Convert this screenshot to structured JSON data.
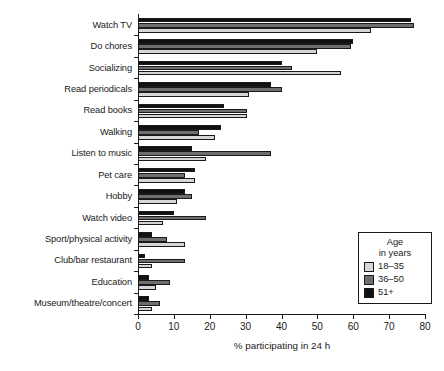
{
  "chart_data": {
    "type": "bar",
    "orientation": "horizontal",
    "title": "",
    "xlabel": "% participating in 24 h",
    "ylabel": "",
    "xlim": [
      0,
      80
    ],
    "xticks": [
      0,
      10,
      20,
      30,
      40,
      50,
      60,
      70,
      80
    ],
    "grid": false,
    "legend_position": "lower-right",
    "legend_title": [
      "Age",
      "in years"
    ],
    "categories": [
      "Watch TV",
      "Do chores",
      "Socializing",
      "Read periodicals",
      "Read books",
      "Walking",
      "Listen to music",
      "Pet care",
      "Hobby",
      "Watch video",
      "Sport/physical activity",
      "Club/bar restaurant",
      "Education",
      "Museum/theatre/concert"
    ],
    "series": [
      {
        "name": "18–35",
        "color": "#d6d6d6",
        "values": [
          65,
          50,
          56.5,
          31,
          30.5,
          21.5,
          19,
          16,
          11,
          7,
          13,
          4,
          5,
          4
        ]
      },
      {
        "name": "36–50",
        "color": "#6e6e6e",
        "values": [
          77,
          59.5,
          43,
          40,
          30.5,
          17,
          37,
          13,
          15,
          19,
          8,
          13,
          9,
          6
        ]
      },
      {
        "name": "51+",
        "color": "#111111",
        "values": [
          76,
          60,
          40,
          37,
          24,
          23,
          15,
          16,
          13,
          10,
          4,
          2,
          3,
          3
        ]
      }
    ]
  },
  "legend": {
    "title_line1": "Age",
    "title_line2": "in years",
    "items": [
      {
        "label": "18–35"
      },
      {
        "label": "36–50"
      },
      {
        "label": "51+"
      }
    ]
  },
  "axis": {
    "x_title": "% participating in 24 h"
  }
}
